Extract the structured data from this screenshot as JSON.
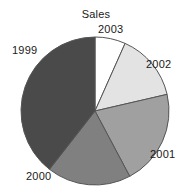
{
  "chart_data": {
    "type": "pie",
    "title": "Sales",
    "categories": [
      "2003",
      "2002",
      "2001",
      "2000",
      "1999"
    ],
    "values": [
      6.7,
      14.7,
      20.8,
      18.3,
      39.5
    ],
    "unit": "percent",
    "start_angle_deg": 0,
    "direction": "clockwise",
    "slice_angles_deg": [
      24,
      53,
      75,
      66,
      142
    ],
    "colors": [
      "#ffffff",
      "#e3e3e3",
      "#a0a0a0",
      "#808080",
      "#4a4a4a"
    ],
    "slice_outline_color": "#555555",
    "legend": "none",
    "labels_position": "outside",
    "grid": false,
    "xlabel": "",
    "ylabel": ""
  },
  "geometry": {
    "center_x": 95,
    "center_y": 111,
    "radius": 74
  },
  "labels": {
    "y2003": "2003",
    "y2002": "2002",
    "y2001": "2001",
    "y2000": "2000",
    "y1999": "1999"
  }
}
